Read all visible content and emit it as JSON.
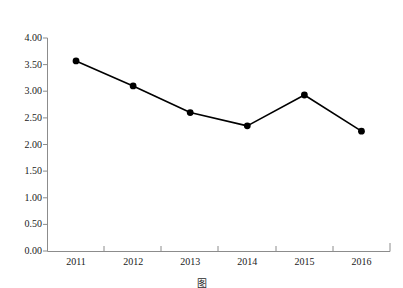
{
  "chart_data": {
    "type": "line",
    "title": "",
    "ylabel": "长轴/短轴",
    "xlabel": "",
    "categories": [
      "2011",
      "2012",
      "2013",
      "2014",
      "2015",
      "2016"
    ],
    "x": [
      2011,
      2012,
      2013,
      2014,
      2015,
      2016
    ],
    "values": [
      3.57,
      3.1,
      2.6,
      2.35,
      2.93,
      2.25
    ],
    "series": [
      {
        "name": "长轴/短轴",
        "values": [
          3.57,
          3.1,
          2.6,
          2.35,
          2.93,
          2.25
        ]
      }
    ],
    "ylim": [
      0.0,
      4.0
    ],
    "ytick_labels": [
      "0.00",
      "0.50",
      "1.00",
      "1.50",
      "2.00",
      "2.50",
      "3.00",
      "3.50",
      "4.00"
    ],
    "ytick_values": [
      0.0,
      0.5,
      1.0,
      1.5,
      2.0,
      2.5,
      3.0,
      3.5,
      4.0
    ],
    "xtick_labels": [
      "2011",
      "2012",
      "2013",
      "2014",
      "2015",
      "2016"
    ],
    "grid": false,
    "legend": false,
    "legend_position": "none",
    "marker": "filled-circle",
    "line_color": "#000000",
    "marker_color": "#000000",
    "axis_color": "#808080",
    "background": "#ffffff"
  },
  "caption": {
    "text": "图"
  }
}
